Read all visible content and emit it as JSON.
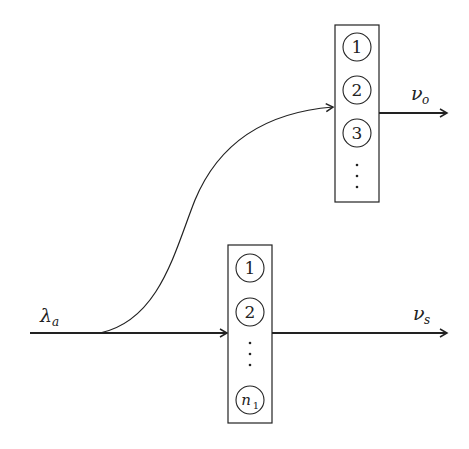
{
  "diagram": {
    "input_label": {
      "main": "λ",
      "sub": "a"
    },
    "upper_output_label": {
      "main": "ν",
      "sub": "o"
    },
    "lower_output_label": {
      "main": "ν",
      "sub": "s"
    },
    "upper_box": {
      "items": [
        "1",
        "2",
        "3"
      ],
      "ellipsis": "⋮"
    },
    "lower_box": {
      "items": [
        "1",
        "2"
      ],
      "ellipsis": "⋮",
      "last": {
        "main": "n",
        "sub": "1"
      }
    },
    "colors": {
      "stroke": "#222222",
      "background": "#ffffff"
    }
  }
}
